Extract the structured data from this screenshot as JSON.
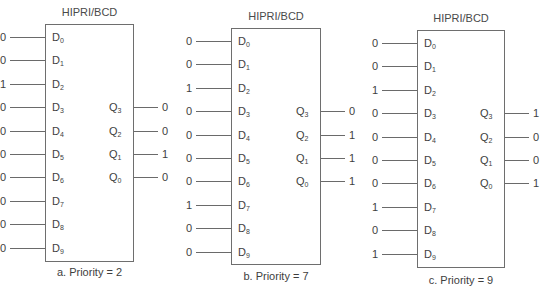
{
  "encoders": [
    {
      "id": "a",
      "title": "HIPRI/BCD",
      "caption": "a. Priority = 2",
      "inputs": [
        {
          "pin": "D",
          "sub": "0",
          "value": "0"
        },
        {
          "pin": "D",
          "sub": "1",
          "value": "0"
        },
        {
          "pin": "D",
          "sub": "2",
          "value": "1"
        },
        {
          "pin": "D",
          "sub": "3",
          "value": "0"
        },
        {
          "pin": "D",
          "sub": "4",
          "value": "0"
        },
        {
          "pin": "D",
          "sub": "5",
          "value": "0"
        },
        {
          "pin": "D",
          "sub": "6",
          "value": "0"
        },
        {
          "pin": "D",
          "sub": "7",
          "value": "0"
        },
        {
          "pin": "D",
          "sub": "8",
          "value": "0"
        },
        {
          "pin": "D",
          "sub": "9",
          "value": "0"
        }
      ],
      "outputs": [
        {
          "pin": "Q",
          "sub": "3",
          "value": "0"
        },
        {
          "pin": "Q",
          "sub": "2",
          "value": "0"
        },
        {
          "pin": "Q",
          "sub": "1",
          "value": "1"
        },
        {
          "pin": "Q",
          "sub": "0",
          "value": "0"
        }
      ]
    },
    {
      "id": "b",
      "title": "HIPRI/BCD",
      "caption": "b. Priority = 7",
      "inputs": [
        {
          "pin": "D",
          "sub": "0",
          "value": "0"
        },
        {
          "pin": "D",
          "sub": "1",
          "value": "0"
        },
        {
          "pin": "D",
          "sub": "2",
          "value": "1"
        },
        {
          "pin": "D",
          "sub": "3",
          "value": "0"
        },
        {
          "pin": "D",
          "sub": "4",
          "value": "0"
        },
        {
          "pin": "D",
          "sub": "5",
          "value": "0"
        },
        {
          "pin": "D",
          "sub": "6",
          "value": "0"
        },
        {
          "pin": "D",
          "sub": "7",
          "value": "1"
        },
        {
          "pin": "D",
          "sub": "8",
          "value": "0"
        },
        {
          "pin": "D",
          "sub": "9",
          "value": "0"
        }
      ],
      "outputs": [
        {
          "pin": "Q",
          "sub": "3",
          "value": "0"
        },
        {
          "pin": "Q",
          "sub": "2",
          "value": "1"
        },
        {
          "pin": "Q",
          "sub": "1",
          "value": "1"
        },
        {
          "pin": "Q",
          "sub": "0",
          "value": "1"
        }
      ]
    },
    {
      "id": "c",
      "title": "HIPRI/BCD",
      "caption": "c. Priority = 9",
      "inputs": [
        {
          "pin": "D",
          "sub": "0",
          "value": "0"
        },
        {
          "pin": "D",
          "sub": "1",
          "value": "0"
        },
        {
          "pin": "D",
          "sub": "2",
          "value": "1"
        },
        {
          "pin": "D",
          "sub": "3",
          "value": "0"
        },
        {
          "pin": "D",
          "sub": "4",
          "value": "0"
        },
        {
          "pin": "D",
          "sub": "5",
          "value": "0"
        },
        {
          "pin": "D",
          "sub": "6",
          "value": "0"
        },
        {
          "pin": "D",
          "sub": "7",
          "value": "1"
        },
        {
          "pin": "D",
          "sub": "8",
          "value": "0"
        },
        {
          "pin": "D",
          "sub": "9",
          "value": "1"
        }
      ],
      "outputs": [
        {
          "pin": "Q",
          "sub": "3",
          "value": "1"
        },
        {
          "pin": "Q",
          "sub": "2",
          "value": "0"
        },
        {
          "pin": "Q",
          "sub": "1",
          "value": "0"
        },
        {
          "pin": "Q",
          "sub": "0",
          "value": "1"
        }
      ]
    }
  ]
}
